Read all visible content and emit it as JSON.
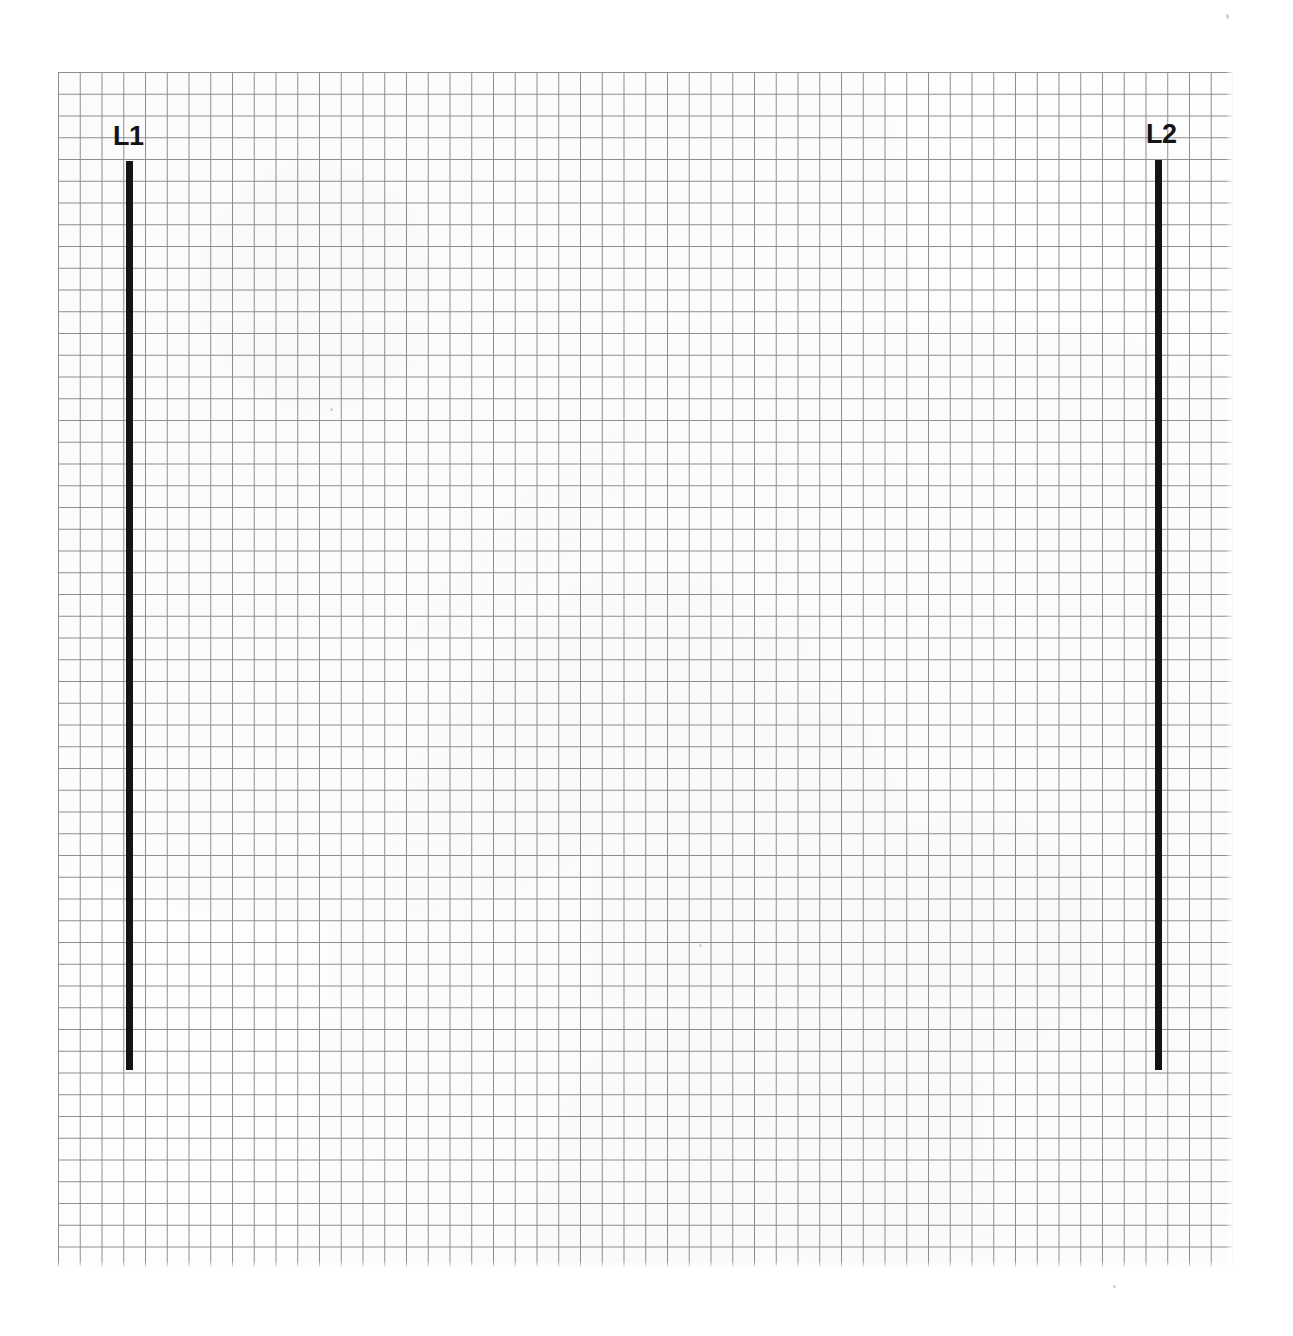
{
  "figure": {
    "background_color": "#ffffff",
    "grid": {
      "line_color": "#8d8d8d",
      "cell_size_px": 21.75,
      "left_px": 58,
      "top_px": 72,
      "width_px": 1177,
      "height_px": 1197,
      "columns": 54,
      "rows": 55
    },
    "segments": [
      {
        "label": "L1",
        "color": "#141414",
        "orientation": "vertical",
        "x_px": 126,
        "y_top_px": 161,
        "y_bottom_px": 1070,
        "length_px": 909,
        "thickness_px": 7,
        "label_x_px": 113,
        "label_y_px": 123
      },
      {
        "label": "L2",
        "color": "#141414",
        "orientation": "vertical",
        "x_px": 1155,
        "y_top_px": 160,
        "y_bottom_px": 1070,
        "length_px": 910,
        "thickness_px": 7,
        "label_x_px": 1146,
        "label_y_px": 121
      }
    ]
  },
  "chart_data": {
    "type": "scatter",
    "xlabel": "",
    "ylabel": "",
    "grid": true,
    "legend_position": "none",
    "annotations": [
      "L1",
      "L2"
    ],
    "series": [
      {
        "name": "L1",
        "x": [
          3.1,
          3.1
        ],
        "y": [
          4.1,
          45.9
        ],
        "length_cells": 41.8,
        "orientation": "vertical"
      },
      {
        "name": "L2",
        "x": [
          50.4,
          50.4
        ],
        "y": [
          4.0,
          45.9
        ],
        "length_cells": 41.9,
        "orientation": "vertical"
      }
    ]
  }
}
